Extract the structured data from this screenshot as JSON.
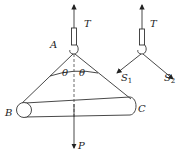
{
  "diagram": {
    "left_figure": {
      "labels": {
        "tension": "T",
        "hook_point": "A",
        "angle_left": "θ",
        "angle_right": "θ",
        "end_left": "B",
        "end_right": "C",
        "weight": "P"
      }
    },
    "right_figure": {
      "labels": {
        "tension": "T",
        "force_1": "S",
        "force_1_sub": "1",
        "force_2": "S",
        "force_2_sub": "2"
      }
    }
  }
}
